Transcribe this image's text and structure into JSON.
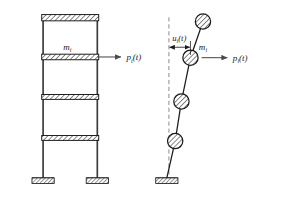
{
  "figure": {
    "name": "multistory-frame-and-lumped-mass-model",
    "background_color": "#ffffff",
    "line_color": "#1a1a1a",
    "hatch_color": "#1a1a1a",
    "width": 285,
    "height": 221
  },
  "left_panel": {
    "name": "multistory-frame",
    "description": "Four-story planar frame elevation with hatched floor beams and fixed bases",
    "story_count": 4,
    "mass_label": "m",
    "mass_subscript": "i",
    "force_label": "p",
    "force_subscript": "i",
    "force_argument": "(t)",
    "columns": [
      {
        "name": "left-column",
        "x": 62
      },
      {
        "name": "right-column",
        "x": 140
      }
    ],
    "floor_beams": [
      {
        "name": "roof-beam",
        "y": 18
      },
      {
        "name": "floor-beam-3",
        "y": 73
      },
      {
        "name": "floor-beam-2",
        "y": 131
      },
      {
        "name": "floor-beam-1",
        "y": 190
      }
    ],
    "supports": [
      {
        "name": "left-fixed-support",
        "x": 62
      },
      {
        "name": "right-fixed-support",
        "x": 140
      }
    ],
    "force_arrow": {
      "name": "lateral-force-arrow",
      "from_x": 140,
      "to_x": 174,
      "y": 73
    }
  },
  "right_panel": {
    "name": "lumped-mass-stick-model",
    "description": "Deflected cantilever stick model with four lumped masses, undeformed dashed reference axis and fixed base",
    "mass_label": "m",
    "mass_subscript": "i",
    "force_label": "p",
    "force_subscript": "i",
    "force_argument": "(t)",
    "displacement_label": "u",
    "displacement_subscript": "i",
    "displacement_argument": "(t)",
    "reference_axis": {
      "name": "undeformed-axis",
      "style": "dashed",
      "x": 243,
      "top_y": 16,
      "bottom_y": 247
    },
    "base": {
      "name": "fixed-base-support",
      "x": 240,
      "y": 247
    },
    "masses": [
      {
        "name": "mass-4-top",
        "x": 292,
        "y": 22,
        "radius": 11
      },
      {
        "name": "mass-3",
        "x": 274,
        "y": 74,
        "radius": 11
      },
      {
        "name": "mass-2",
        "x": 261,
        "y": 137,
        "radius": 11
      },
      {
        "name": "mass-1",
        "x": 252,
        "y": 194,
        "radius": 11
      }
    ],
    "force_arrow": {
      "name": "lateral-force-arrow",
      "from_x": 290,
      "to_x": 327,
      "y": 74
    },
    "displacement_dimension": {
      "name": "displacement-dimension",
      "from_x": 243,
      "to_x": 274,
      "y": 59
    }
  }
}
